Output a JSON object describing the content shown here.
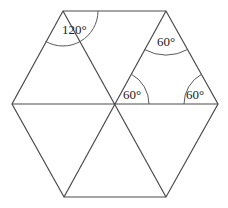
{
  "diagram": {
    "shape": "regular hexagon divided into six equilateral triangles",
    "vertices": {
      "top_left": [
        63,
        11
      ],
      "top_right": [
        166,
        11
      ],
      "right": [
        218,
        104
      ],
      "bottom_right": [
        166,
        197
      ],
      "bottom_left": [
        64,
        197
      ],
      "left": [
        12,
        104
      ],
      "center": [
        115,
        104
      ]
    },
    "angle_labels": [
      {
        "id": "top-left-angle",
        "text": "120°",
        "x": 81,
        "y": 33
      },
      {
        "id": "top-triangle-apex-angle",
        "text": "60°",
        "x": 166,
        "y": 46
      },
      {
        "id": "center-angle",
        "text": "60°",
        "x": 136,
        "y": 99
      },
      {
        "id": "right-angle",
        "text": "60°",
        "x": 200,
        "y": 99
      }
    ]
  }
}
